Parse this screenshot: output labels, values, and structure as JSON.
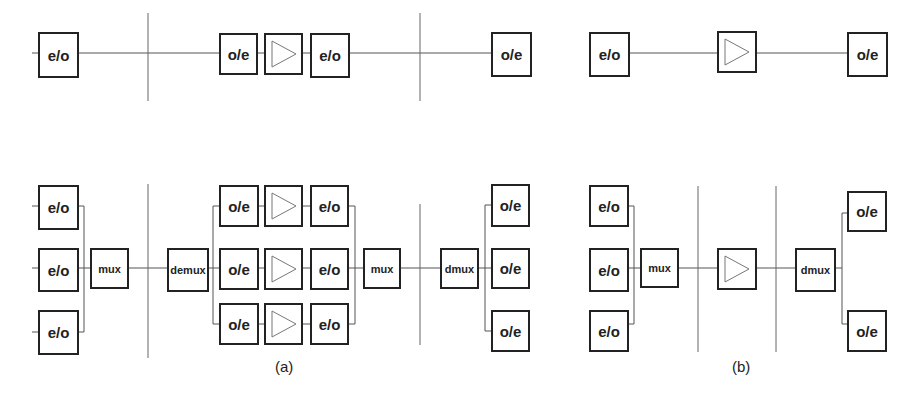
{
  "labels": {
    "eo": "e/o",
    "oe": "o/e",
    "mux": "mux",
    "demux": "demux",
    "dmux": "dmux",
    "caption_a": "(a)",
    "caption_b": "(b)"
  },
  "colors": {
    "stroke": "#222222",
    "line": "#555555",
    "amp": "#777777",
    "background": "#ffffff"
  }
}
